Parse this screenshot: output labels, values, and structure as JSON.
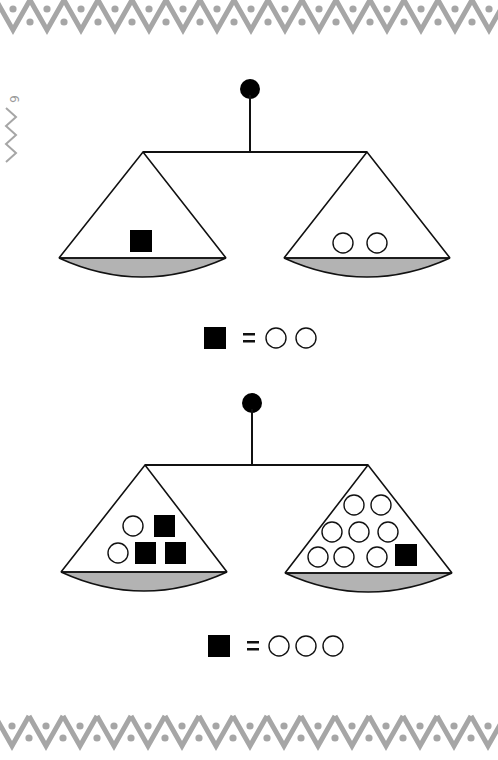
{
  "page": {
    "number": "6",
    "border_color": "#a6a6a6"
  },
  "colors": {
    "ink": "#111111",
    "pan_fill": "#b3b3b3",
    "weight_square": "#000000",
    "weight_circle": "#ffffff"
  },
  "scales": [
    {
      "id": "scale-1",
      "left_pan": {
        "squares": 1,
        "circles": 0
      },
      "right_pan": {
        "squares": 0,
        "circles": 2
      },
      "balanced": true
    },
    {
      "id": "scale-2",
      "left_pan": {
        "squares": 3,
        "circles": 2
      },
      "right_pan": {
        "squares": 1,
        "circles": 8
      },
      "balanced": true
    }
  ],
  "equations": [
    {
      "lhs": "■",
      "equals": "=",
      "rhs_circles": 2,
      "text": "■ = ○○"
    },
    {
      "lhs": "■",
      "equals": "=",
      "rhs_circles": 3,
      "text": "■ = ○○○"
    }
  ]
}
